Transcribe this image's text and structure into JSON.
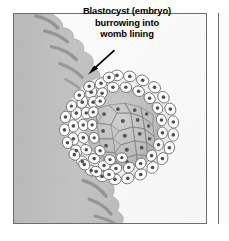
{
  "figure": {
    "name": "blastocyst-implantation-diagram",
    "caption": {
      "line1": "Blastocyst (embryo)",
      "line2": "burrowing into",
      "line3": "womb lining"
    },
    "annotation": {
      "arrow": "arrow-pointing-to-blastocyst",
      "direction": "down-left"
    },
    "parts": [
      {
        "name": "womb-lining",
        "label": "womb lining",
        "color": "#c0c0c0"
      },
      {
        "name": "blastocyst",
        "label": "Blastocyst (embryo)",
        "color": "#efefef"
      },
      {
        "name": "trophoblast-cells",
        "label": "outer cell layer",
        "color": "#fdfdfd"
      },
      {
        "name": "inner-cell-mass",
        "label": "inner cell mass",
        "color": "#bcbcbc"
      },
      {
        "name": "cell-nucleus",
        "label": "nucleus",
        "color": "#585858"
      }
    ],
    "colors": {
      "background": "#fafafa",
      "lining_fill": "#c0c0c0",
      "lining_shadow": "#8e8e8e",
      "cell_outline": "#6b6b6b",
      "nucleus": "#4f4f4f",
      "border": "#6e6e6e",
      "text": "#000000"
    }
  }
}
